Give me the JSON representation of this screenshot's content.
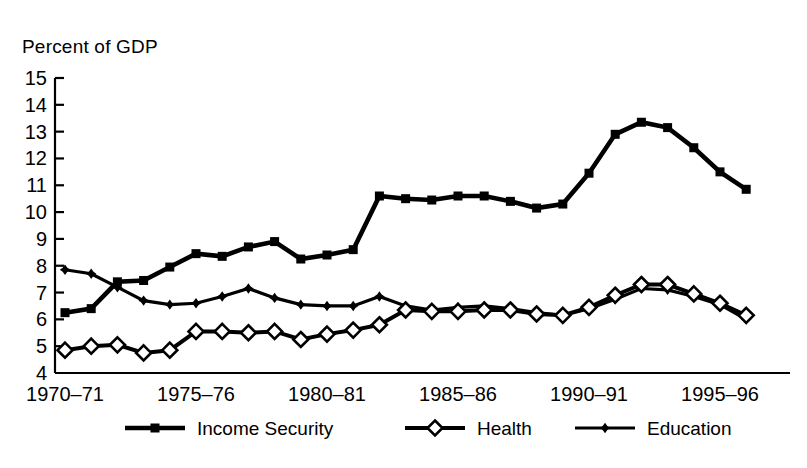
{
  "chart_data": {
    "type": "line",
    "title": "",
    "ylabel": "Percent of GDP",
    "xlabel": "",
    "ylim": [
      4,
      15
    ],
    "yticks": [
      4,
      5,
      6,
      7,
      8,
      9,
      10,
      11,
      12,
      13,
      14,
      15
    ],
    "ytick_labels": [
      "4",
      "5",
      "6",
      "7",
      "8",
      "9",
      "10",
      "11",
      "12",
      "13",
      "14",
      "15"
    ],
    "grid": false,
    "legend_position": "bottom",
    "x": [
      "1970-71",
      "1971-72",
      "1972-73",
      "1973-74",
      "1974-75",
      "1975-76",
      "1976-77",
      "1977-78",
      "1978-79",
      "1979-80",
      "1980-81",
      "1981-82",
      "1982-83",
      "1983-84",
      "1984-85",
      "1985-86",
      "1986-87",
      "1987-88",
      "1988-89",
      "1989-90",
      "1990-91",
      "1991-92",
      "1992-93",
      "1993-94",
      "1994-95",
      "1995-96",
      "1996-97"
    ],
    "xtick_labels": [
      "1970–71",
      "1975–76",
      "1980–81",
      "1985–86",
      "1990–91",
      "1995–96"
    ],
    "xtick_positions": [
      0,
      5,
      10,
      15,
      20,
      25
    ],
    "series": [
      {
        "name": "Income Security",
        "marker": "filled-square",
        "values": [
          6.25,
          6.4,
          7.4,
          7.45,
          7.95,
          8.45,
          8.35,
          8.7,
          8.9,
          8.25,
          8.4,
          8.6,
          10.6,
          10.5,
          10.45,
          10.6,
          10.6,
          10.4,
          10.15,
          10.3,
          11.45,
          12.9,
          13.35,
          13.15,
          12.4,
          11.5,
          10.85
        ]
      },
      {
        "name": "Health",
        "marker": "open-diamond",
        "values": [
          4.85,
          5.0,
          5.05,
          4.75,
          4.85,
          5.55,
          5.55,
          5.5,
          5.55,
          5.25,
          5.45,
          5.6,
          5.8,
          6.35,
          6.3,
          6.3,
          6.35,
          6.35,
          6.2,
          6.15,
          6.45,
          6.9,
          7.3,
          7.3,
          6.95,
          6.6,
          6.15
        ]
      },
      {
        "name": "Education",
        "marker": "small-star",
        "values": [
          7.85,
          7.7,
          7.2,
          6.7,
          6.55,
          6.6,
          6.85,
          7.15,
          6.8,
          6.55,
          6.5,
          6.5,
          6.85,
          6.5,
          6.35,
          6.45,
          6.5,
          6.4,
          6.25,
          6.15,
          6.4,
          6.75,
          7.15,
          7.1,
          6.85,
          6.55,
          6.0
        ]
      }
    ]
  },
  "legend": {
    "items": [
      {
        "label": "Income Security",
        "marker": "filled-square"
      },
      {
        "label": "Health",
        "marker": "open-diamond"
      },
      {
        "label": "Education",
        "marker": "small-star"
      }
    ]
  }
}
